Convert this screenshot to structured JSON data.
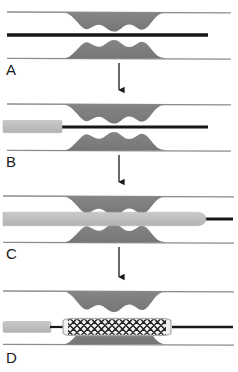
{
  "figure": {
    "width": 238,
    "height": 372
  },
  "colors": {
    "background": "#ffffff",
    "vessel_wall": "#8c8c8c",
    "plaque_fill": "#7e7e7e",
    "plaque_edge": "#6e6e6e",
    "guidewire": "#171717",
    "catheter_balloon": "#bcbcbc",
    "catheter_edge": "#a8a8a8",
    "stent_mesh_dark": "#2a2a2a",
    "stent_mesh_light": "#f2f2f2",
    "stent_body": "#e8e8e8",
    "arrow": "#1a1a1a",
    "label_text": "#1a1a1a"
  },
  "panels": [
    {
      "id": "A",
      "label": "A",
      "label_x": 6,
      "label_y": 70,
      "stage": "guidewire-across-lesion",
      "caption_implicit": "Guidewire advanced across the stenotic plaque",
      "top_wall_y": 12,
      "bottom_wall_y": 58,
      "guidewire_y": 35,
      "guidewire_x_start": 7,
      "guidewire_x_end": 208,
      "catheter_present": false,
      "stent_present": false
    },
    {
      "id": "B",
      "label": "B",
      "label_x": 6,
      "label_y": 162,
      "stage": "balloon-catheter-advancing",
      "caption_implicit": "Balloon catheter advanced over the guidewire toward the lesion",
      "top_wall_y": 104,
      "bottom_wall_y": 150,
      "guidewire_y": 127,
      "guidewire_x_start": 7,
      "guidewire_x_end": 208,
      "catheter_present": true,
      "catheter_x_start": 3,
      "catheter_x_end": 62,
      "stent_present": false
    },
    {
      "id": "C",
      "label": "C",
      "label_x": 6,
      "label_y": 254,
      "stage": "balloon-positioned-across-lesion",
      "caption_implicit": "Balloon catheter positioned across the stenosis",
      "top_wall_y": 196,
      "bottom_wall_y": 242,
      "guidewire_y": 219,
      "guidewire_x_start": 3,
      "guidewire_x_end": 232,
      "catheter_present": true,
      "catheter_x_start": 3,
      "catheter_x_end": 205,
      "stent_present": false
    },
    {
      "id": "D",
      "label": "D",
      "label_x": 6,
      "label_y": 360,
      "stage": "stent-deployed",
      "caption_implicit": "Stent deployed and expanded within the plaque segment",
      "top_wall_y": 291,
      "bottom_wall_y": 344,
      "guidewire_y": 327,
      "guidewire_x_start": 3,
      "guidewire_x_end": 232,
      "catheter_present": true,
      "catheter_x_start": 3,
      "catheter_x_end": 52,
      "stent_present": true,
      "stent_x_start": 63,
      "stent_x_end": 170,
      "stent_mesh_pattern": "diamond-cross-hatch"
    }
  ],
  "arrows": [
    {
      "id": "arrow-a-to-b",
      "x": 119,
      "y_start": 62,
      "y_end": 96,
      "direction": "down"
    },
    {
      "id": "arrow-b-to-c",
      "x": 119,
      "y_start": 154,
      "y_end": 188,
      "direction": "down"
    },
    {
      "id": "arrow-c-to-d",
      "x": 119,
      "y_start": 246,
      "y_end": 283,
      "direction": "down"
    }
  ],
  "plaque": {
    "x_start": 63,
    "x_end": 170,
    "lobe_count": 4,
    "max_thickness": 17,
    "narrow_max_thickness": 11,
    "description": "Lobulated atheromatous plaque narrowing the lumen symmetrically from both walls"
  }
}
